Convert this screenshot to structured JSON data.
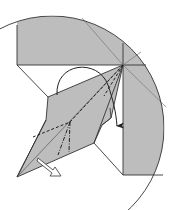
{
  "diagram": {
    "colors": {
      "paper": "#bdbdbd",
      "line": "#333333",
      "background": "#ffffff",
      "arrow_fill": "#ffffff"
    },
    "elements": {
      "circle_frame": "magnified-view-circle",
      "fold_arrow": "curved-fold-arrow",
      "push_arrow": "hollow-push-arrow",
      "valley_folds": "dashed-fold-lines",
      "mountain_folds": "dash-dot-fold-lines"
    }
  }
}
